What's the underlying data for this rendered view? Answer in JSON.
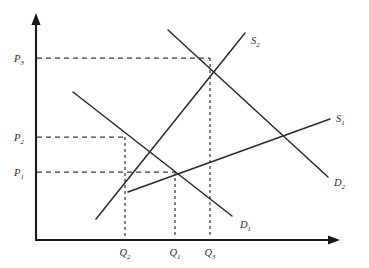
{
  "figure": {
    "type": "economics-supply-demand"
  },
  "axes": {
    "y_axis_name": "Price",
    "x_axis_name": "Quantity",
    "origin_x": 36,
    "origin_y": 240,
    "y_top": 15,
    "x_right": 340
  },
  "price_labels": [
    {
      "id": "P3",
      "base": "P",
      "sub": "3",
      "y": 58
    },
    {
      "id": "P2",
      "base": "P",
      "sub": "2",
      "y": 137
    },
    {
      "id": "P1",
      "base": "P",
      "sub": "1",
      "y": 172
    }
  ],
  "quantity_labels": [
    {
      "id": "Q2",
      "base": "Q",
      "sub": "2",
      "x": 125
    },
    {
      "id": "Q1",
      "base": "Q",
      "sub": "1",
      "x": 175
    },
    {
      "id": "Q3",
      "base": "Q",
      "sub": "3",
      "x": 210
    }
  ],
  "curves": [
    {
      "id": "D1",
      "base": "D",
      "sub": "1",
      "kind": "demand",
      "x1": 73,
      "y1": 92,
      "x2": 232,
      "y2": 216,
      "label_x": 240,
      "label_y": 228
    },
    {
      "id": "D2",
      "base": "D",
      "sub": "2",
      "kind": "demand",
      "x1": 168,
      "y1": 30,
      "x2": 328,
      "y2": 177,
      "label_x": 334,
      "label_y": 186
    },
    {
      "id": "S1",
      "base": "S",
      "sub": "1",
      "kind": "supply",
      "x1": 128,
      "y1": 192,
      "x2": 330,
      "y2": 119,
      "label_x": 336,
      "label_y": 122
    },
    {
      "id": "S2",
      "base": "S",
      "sub": "2",
      "kind": "supply",
      "x1": 96,
      "y1": 219,
      "x2": 245,
      "y2": 33,
      "label_x": 251,
      "label_y": 44
    }
  ],
  "equilibria": [
    {
      "id": "E2",
      "price": "P2",
      "quantity": "Q2",
      "x": 125,
      "y": 137
    },
    {
      "id": "E1",
      "price": "P1",
      "quantity": "Q1",
      "x": 175,
      "y": 172
    },
    {
      "id": "E3",
      "price": "P3",
      "quantity": "Q3",
      "x": 210,
      "y": 58
    }
  ],
  "chart_data": {
    "type": "line",
    "xlabel": "Quantity",
    "ylabel": "Price",
    "grid": false,
    "legend": "inline-curve-labels",
    "xlim": [
      0,
      340
    ],
    "ylim": [
      0,
      240
    ],
    "tick_labels": {
      "x": [
        "Q2",
        "Q1",
        "Q3"
      ],
      "y": [
        "P1",
        "P2",
        "P3"
      ]
    },
    "series": [
      {
        "name": "D1",
        "type": "demand",
        "points": [
          [
            73,
            92
          ],
          [
            232,
            216
          ]
        ]
      },
      {
        "name": "D2",
        "type": "demand",
        "points": [
          [
            168,
            30
          ],
          [
            328,
            177
          ]
        ]
      },
      {
        "name": "S1",
        "type": "supply",
        "points": [
          [
            128,
            192
          ],
          [
            330,
            119
          ]
        ]
      },
      {
        "name": "S2",
        "type": "supply",
        "points": [
          [
            96,
            219
          ],
          [
            245,
            33
          ]
        ]
      }
    ],
    "annotations": [
      {
        "text": "P3",
        "at": [
          36,
          58
        ]
      },
      {
        "text": "P2",
        "at": [
          36,
          137
        ]
      },
      {
        "text": "P1",
        "at": [
          36,
          172
        ]
      },
      {
        "text": "Q2",
        "at": [
          125,
          240
        ]
      },
      {
        "text": "Q1",
        "at": [
          175,
          240
        ]
      },
      {
        "text": "Q3",
        "at": [
          210,
          240
        ]
      }
    ],
    "intersections": [
      {
        "label": "D1 x S1",
        "price": "P1",
        "quantity": "Q1"
      },
      {
        "label": "D1 x S2",
        "price": "P2",
        "quantity": "Q2"
      },
      {
        "label": "D2 x S2",
        "price": "P3",
        "quantity": "Q3"
      }
    ]
  }
}
